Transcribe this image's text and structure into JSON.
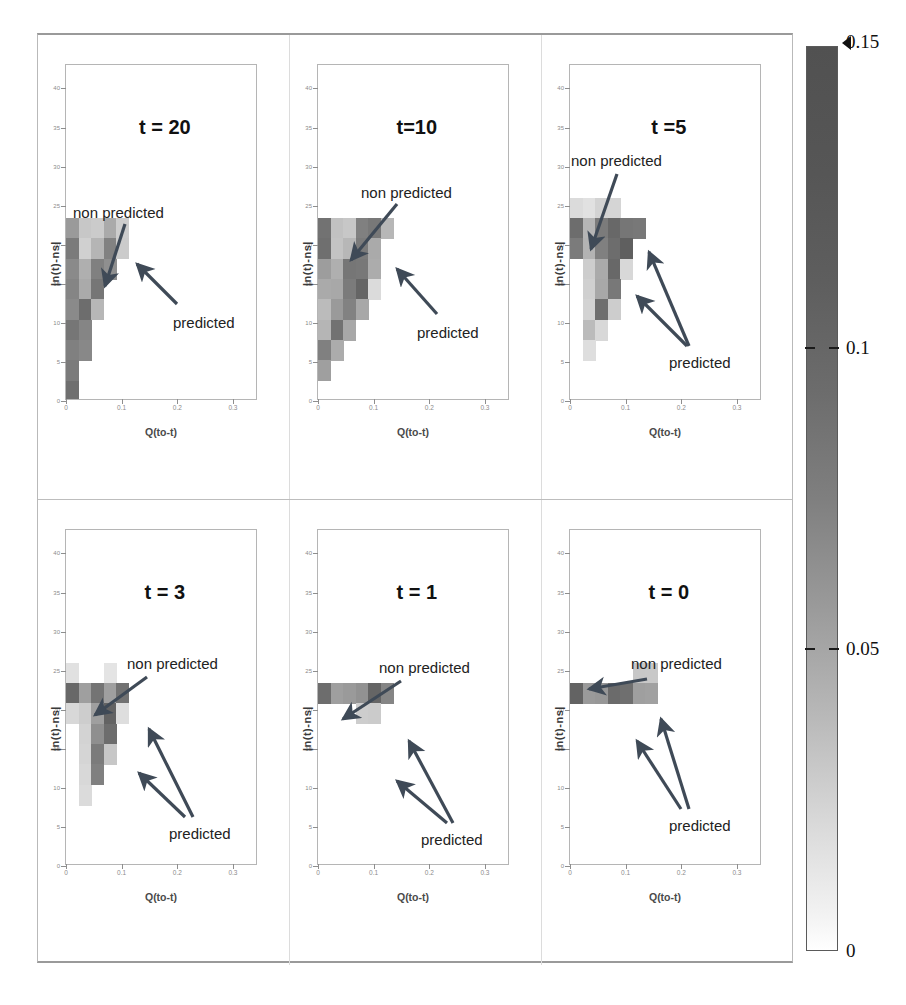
{
  "figure": {
    "colorbar": {
      "name": "probability-colorbar",
      "ticks": [
        {
          "label": "0.15",
          "value": 0.15,
          "pos": 1.0,
          "over_marker": true
        },
        {
          "label": "0.1",
          "value": 0.1,
          "pos": 0.6667
        },
        {
          "label": "0.05",
          "value": 0.05,
          "pos": 0.3333
        },
        {
          "label": "0",
          "value": 0,
          "pos": 0.0
        }
      ],
      "vmin": 0,
      "vmax": 0.15,
      "colormap": "grayscale-inverted",
      "low_color": "#ffffff",
      "high_color": "#515151"
    },
    "axis": {
      "ylabel": "|n(t)-ns|",
      "xlabel": "Q(to-t)",
      "yticks": [
        "40",
        "35",
        "30",
        "25",
        "20",
        "15",
        "10",
        "5",
        "0"
      ],
      "ytick_values": [
        40,
        35,
        30,
        25,
        20,
        15,
        10,
        5,
        0
      ],
      "xticks": [
        "0",
        "0.1",
        "0.2",
        "0.3"
      ],
      "xtick_values": [
        0,
        0.1,
        0.2,
        0.3
      ],
      "ylim": [
        0,
        43
      ],
      "xlim": [
        0,
        0.345
      ]
    },
    "annotations": {
      "non_predicted": "non predicted",
      "predicted": "predicted"
    }
  },
  "chart_data": {
    "type": "heatmap",
    "title": "",
    "xlabel": "Q(to-t)",
    "ylabel": "|n(t)-ns|",
    "xlim": [
      0,
      0.345
    ],
    "ylim": [
      0,
      43
    ],
    "grid": false,
    "legend": "colorbar-right",
    "colorbar": {
      "vmin": 0,
      "vmax": 0.15,
      "ticks": [
        0,
        0.05,
        0.1,
        0.15
      ],
      "extend": "max"
    },
    "xbin_width": 0.0225,
    "ybin_width": 2.6,
    "panels": [
      {
        "id": "panel-t20",
        "title": "t = 20",
        "row": 0,
        "col": 0,
        "annotations": [
          {
            "text": "non predicted",
            "target": "upper-left-cluster"
          },
          {
            "text": "predicted",
            "target": "right-edge-cluster"
          }
        ],
        "cells": [
          {
            "xi": 0,
            "yi": 8,
            "v": 0.075
          },
          {
            "xi": 1,
            "yi": 8,
            "v": 0.035
          },
          {
            "xi": 2,
            "yi": 8,
            "v": 0.032
          },
          {
            "xi": 3,
            "yi": 8,
            "v": 0.06
          },
          {
            "xi": 4,
            "yi": 8,
            "v": 0.03
          },
          {
            "xi": 0,
            "yi": 7,
            "v": 0.105
          },
          {
            "xi": 1,
            "yi": 7,
            "v": 0.028
          },
          {
            "xi": 2,
            "yi": 7,
            "v": 0.05
          },
          {
            "xi": 3,
            "yi": 7,
            "v": 0.098
          },
          {
            "xi": 4,
            "yi": 7,
            "v": 0.032
          },
          {
            "xi": 0,
            "yi": 6,
            "v": 0.09
          },
          {
            "xi": 1,
            "yi": 6,
            "v": 0.055
          },
          {
            "xi": 2,
            "yi": 6,
            "v": 0.1
          },
          {
            "xi": 3,
            "yi": 6,
            "v": 0.085
          },
          {
            "xi": 0,
            "yi": 5,
            "v": 0.095
          },
          {
            "xi": 1,
            "yi": 5,
            "v": 0.06
          },
          {
            "xi": 2,
            "yi": 5,
            "v": 0.11
          },
          {
            "xi": 0,
            "yi": 4,
            "v": 0.09
          },
          {
            "xi": 1,
            "yi": 4,
            "v": 0.12
          },
          {
            "xi": 2,
            "yi": 4,
            "v": 0.048
          },
          {
            "xi": 0,
            "yi": 3,
            "v": 0.11
          },
          {
            "xi": 1,
            "yi": 3,
            "v": 0.095
          },
          {
            "xi": 0,
            "yi": 2,
            "v": 0.1
          },
          {
            "xi": 1,
            "yi": 2,
            "v": 0.092
          },
          {
            "xi": 0,
            "yi": 1,
            "v": 0.105
          },
          {
            "xi": 0,
            "yi": 0,
            "v": 0.118
          }
        ]
      },
      {
        "id": "panel-t10",
        "title": "t=10",
        "row": 0,
        "col": 1,
        "annotations": [
          {
            "text": "non predicted",
            "target": "upper-left-cluster"
          },
          {
            "text": "predicted",
            "target": "mid-right-cluster"
          }
        ],
        "cells": [
          {
            "xi": 0,
            "yi": 8,
            "v": 0.115
          },
          {
            "xi": 1,
            "yi": 8,
            "v": 0.04
          },
          {
            "xi": 2,
            "yi": 8,
            "v": 0.035
          },
          {
            "xi": 3,
            "yi": 8,
            "v": 0.1
          },
          {
            "xi": 4,
            "yi": 8,
            "v": 0.108
          },
          {
            "xi": 5,
            "yi": 8,
            "v": 0.048
          },
          {
            "xi": 0,
            "yi": 7,
            "v": 0.118
          },
          {
            "xi": 1,
            "yi": 7,
            "v": 0.038
          },
          {
            "xi": 2,
            "yi": 7,
            "v": 0.048
          },
          {
            "xi": 3,
            "yi": 7,
            "v": 0.105
          },
          {
            "xi": 4,
            "yi": 7,
            "v": 0.06
          },
          {
            "xi": 0,
            "yi": 6,
            "v": 0.072
          },
          {
            "xi": 1,
            "yi": 6,
            "v": 0.055
          },
          {
            "xi": 2,
            "yi": 6,
            "v": 0.11
          },
          {
            "xi": 3,
            "yi": 6,
            "v": 0.108
          },
          {
            "xi": 4,
            "yi": 6,
            "v": 0.058
          },
          {
            "xi": 0,
            "yi": 5,
            "v": 0.06
          },
          {
            "xi": 1,
            "yi": 5,
            "v": 0.062
          },
          {
            "xi": 2,
            "yi": 5,
            "v": 0.105
          },
          {
            "xi": 3,
            "yi": 5,
            "v": 0.128
          },
          {
            "xi": 4,
            "yi": 5,
            "v": 0.02
          },
          {
            "xi": 0,
            "yi": 4,
            "v": 0.045
          },
          {
            "xi": 1,
            "yi": 4,
            "v": 0.075
          },
          {
            "xi": 2,
            "yi": 4,
            "v": 0.098
          },
          {
            "xi": 3,
            "yi": 4,
            "v": 0.062
          },
          {
            "xi": 0,
            "yi": 3,
            "v": 0.05
          },
          {
            "xi": 1,
            "yi": 3,
            "v": 0.115
          },
          {
            "xi": 2,
            "yi": 3,
            "v": 0.062
          },
          {
            "xi": 0,
            "yi": 2,
            "v": 0.1
          },
          {
            "xi": 1,
            "yi": 2,
            "v": 0.058
          },
          {
            "xi": 0,
            "yi": 1,
            "v": 0.07
          }
        ]
      },
      {
        "id": "panel-t5",
        "title": "t =5",
        "row": 0,
        "col": 2,
        "annotations": [
          {
            "text": "non predicted",
            "target": "left-cluster"
          },
          {
            "text": "predicted",
            "target": "dark-core"
          }
        ],
        "cells": [
          {
            "xi": 0,
            "yi": 9,
            "v": 0.02
          },
          {
            "xi": 1,
            "yi": 9,
            "v": 0.016
          },
          {
            "xi": 2,
            "yi": 9,
            "v": 0.026
          },
          {
            "xi": 3,
            "yi": 9,
            "v": 0.024
          },
          {
            "xi": 0,
            "yi": 8,
            "v": 0.12
          },
          {
            "xi": 1,
            "yi": 8,
            "v": 0.05
          },
          {
            "xi": 2,
            "yi": 8,
            "v": 0.105
          },
          {
            "xi": 3,
            "yi": 8,
            "v": 0.125
          },
          {
            "xi": 4,
            "yi": 8,
            "v": 0.11
          },
          {
            "xi": 5,
            "yi": 8,
            "v": 0.108
          },
          {
            "xi": 0,
            "yi": 7,
            "v": 0.105
          },
          {
            "xi": 1,
            "yi": 7,
            "v": 0.052
          },
          {
            "xi": 2,
            "yi": 7,
            "v": 0.1
          },
          {
            "xi": 3,
            "yi": 7,
            "v": 0.12
          },
          {
            "xi": 4,
            "yi": 7,
            "v": 0.135
          },
          {
            "xi": 1,
            "yi": 6,
            "v": 0.03
          },
          {
            "xi": 2,
            "yi": 6,
            "v": 0.06
          },
          {
            "xi": 3,
            "yi": 6,
            "v": 0.125
          },
          {
            "xi": 4,
            "yi": 6,
            "v": 0.022
          },
          {
            "xi": 1,
            "yi": 5,
            "v": 0.028
          },
          {
            "xi": 2,
            "yi": 5,
            "v": 0.062
          },
          {
            "xi": 3,
            "yi": 5,
            "v": 0.108
          },
          {
            "xi": 1,
            "yi": 4,
            "v": 0.026
          },
          {
            "xi": 2,
            "yi": 4,
            "v": 0.118
          },
          {
            "xi": 3,
            "yi": 4,
            "v": 0.03
          },
          {
            "xi": 1,
            "yi": 3,
            "v": 0.045
          },
          {
            "xi": 2,
            "yi": 3,
            "v": 0.022
          },
          {
            "xi": 1,
            "yi": 2,
            "v": 0.018
          }
        ]
      },
      {
        "id": "panel-t3",
        "title": "t = 3",
        "row": 1,
        "col": 0,
        "annotations": [
          {
            "text": "non predicted",
            "target": "left-dark-cell"
          },
          {
            "text": "predicted",
            "target": "dark-core"
          }
        ],
        "cells": [
          {
            "xi": 0,
            "yi": 9,
            "v": 0.016
          },
          {
            "xi": 3,
            "yi": 9,
            "v": 0.014
          },
          {
            "xi": 0,
            "yi": 8,
            "v": 0.125
          },
          {
            "xi": 1,
            "yi": 8,
            "v": 0.07
          },
          {
            "xi": 2,
            "yi": 8,
            "v": 0.112
          },
          {
            "xi": 3,
            "yi": 8,
            "v": 0.07
          },
          {
            "xi": 4,
            "yi": 8,
            "v": 0.115
          },
          {
            "xi": 0,
            "yi": 7,
            "v": 0.022
          },
          {
            "xi": 1,
            "yi": 7,
            "v": 0.03
          },
          {
            "xi": 2,
            "yi": 7,
            "v": 0.07
          },
          {
            "xi": 3,
            "yi": 7,
            "v": 0.13
          },
          {
            "xi": 4,
            "yi": 7,
            "v": 0.018
          },
          {
            "xi": 1,
            "yi": 6,
            "v": 0.026
          },
          {
            "xi": 2,
            "yi": 6,
            "v": 0.085
          },
          {
            "xi": 3,
            "yi": 6,
            "v": 0.12
          },
          {
            "xi": 1,
            "yi": 5,
            "v": 0.024
          },
          {
            "xi": 2,
            "yi": 5,
            "v": 0.105
          },
          {
            "xi": 3,
            "yi": 5,
            "v": 0.035
          },
          {
            "xi": 1,
            "yi": 4,
            "v": 0.022
          },
          {
            "xi": 2,
            "yi": 4,
            "v": 0.1
          },
          {
            "xi": 1,
            "yi": 3,
            "v": 0.02
          }
        ]
      },
      {
        "id": "panel-t1",
        "title": "t = 1",
        "row": 1,
        "col": 1,
        "annotations": [
          {
            "text": "non predicted",
            "target": "left-dark-cell"
          },
          {
            "text": "predicted",
            "target": "band-and-below"
          }
        ],
        "cells": [
          {
            "xi": 0,
            "yi": 8,
            "v": 0.12
          },
          {
            "xi": 1,
            "yi": 8,
            "v": 0.07
          },
          {
            "xi": 2,
            "yi": 8,
            "v": 0.075
          },
          {
            "xi": 3,
            "yi": 8,
            "v": 0.082
          },
          {
            "xi": 4,
            "yi": 8,
            "v": 0.128
          },
          {
            "xi": 5,
            "yi": 8,
            "v": 0.095
          },
          {
            "xi": 3,
            "yi": 7,
            "v": 0.03
          },
          {
            "xi": 4,
            "yi": 7,
            "v": 0.032
          }
        ]
      },
      {
        "id": "panel-t0",
        "title": "t = 0",
        "row": 1,
        "col": 2,
        "annotations": [
          {
            "text": "non predicted",
            "target": "upper-right-light-cell"
          },
          {
            "text": "predicted",
            "target": "dark-band"
          }
        ],
        "cells": [
          {
            "xi": 5,
            "yi": 9,
            "v": 0.035
          },
          {
            "xi": 6,
            "yi": 9,
            "v": 0.034
          },
          {
            "xi": 0,
            "yi": 8,
            "v": 0.13
          },
          {
            "xi": 1,
            "yi": 8,
            "v": 0.075
          },
          {
            "xi": 2,
            "yi": 8,
            "v": 0.078
          },
          {
            "xi": 3,
            "yi": 8,
            "v": 0.122
          },
          {
            "xi": 4,
            "yi": 8,
            "v": 0.118
          },
          {
            "xi": 5,
            "yi": 8,
            "v": 0.07
          },
          {
            "xi": 6,
            "yi": 8,
            "v": 0.068
          }
        ]
      }
    ]
  }
}
